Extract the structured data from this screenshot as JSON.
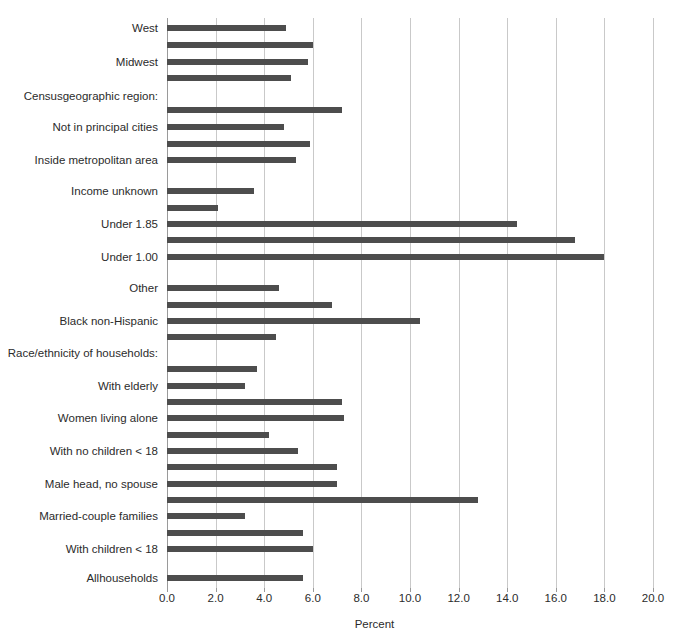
{
  "chart_data": {
    "type": "bar",
    "orientation": "horizontal",
    "title": "",
    "xlabel": "Percent",
    "ylabel": "",
    "xlim": [
      0.0,
      20.0
    ],
    "xticks": [
      "0.0",
      "2.0",
      "4.0",
      "6.0",
      "8.0",
      "10.0",
      "12.0",
      "14.0",
      "16.0",
      "18.0",
      "20.0"
    ],
    "xtick_values": [
      0,
      2,
      4,
      6,
      8,
      10,
      12,
      14,
      16,
      18,
      20
    ],
    "grid": true,
    "legend": "none",
    "bar_color": "#4d4d4d",
    "grid_color": "#c9c9c9",
    "categories": [
      "West",
      "",
      "Midwest",
      "",
      "Censusgeographic region:",
      "Not in principal cities",
      "",
      "Inside metropolitan area",
      "",
      "Income unknown",
      "",
      "Under 1.85",
      "",
      "Under 1.00",
      "",
      "Other",
      "",
      "Black non-Hispanic",
      "",
      "Race/ethnicity of households:",
      "With elderly",
      "",
      "Women living alone",
      "",
      "With no children < 18",
      "",
      "Male head, no spouse",
      "",
      "Married-couple families",
      "",
      "With children < 18",
      "",
      "Allhouseholds"
    ],
    "bars": [
      {
        "label": "West",
        "value": 4.9,
        "row": 0
      },
      {
        "label": "",
        "value": 6.0,
        "row": 1
      },
      {
        "label": "Midwest",
        "value": 5.8,
        "row": 2
      },
      {
        "label": "",
        "value": 5.1,
        "row": 3
      },
      {
        "label": "Censusgeographic region:",
        "value": null,
        "row": 4
      },
      {
        "label": "",
        "value": 7.2,
        "row": 5
      },
      {
        "label": "Not in principal cities",
        "value": 4.8,
        "row": 6
      },
      {
        "label": "",
        "value": 5.9,
        "row": 7
      },
      {
        "label": "Inside metropolitan area",
        "value": 5.3,
        "row": 8
      },
      {
        "label": "",
        "value": null,
        "row": 9
      },
      {
        "label": "Income unknown",
        "value": 3.6,
        "row": 10
      },
      {
        "label": "",
        "value": 2.1,
        "row": 11
      },
      {
        "label": "Under 1.85",
        "value": 14.4,
        "row": 12
      },
      {
        "label": "",
        "value": 16.8,
        "row": 13
      },
      {
        "label": "Under 1.00",
        "value": 18.0,
        "row": 14
      },
      {
        "label": "",
        "value": null,
        "row": 15
      },
      {
        "label": "Other",
        "value": 4.6,
        "row": 16
      },
      {
        "label": "",
        "value": 6.8,
        "row": 17
      },
      {
        "label": "Black non-Hispanic",
        "value": 10.4,
        "row": 18
      },
      {
        "label": "",
        "value": 4.5,
        "row": 19
      },
      {
        "label": "Race/ethnicity of households:",
        "value": null,
        "row": 20
      },
      {
        "label": "",
        "value": 3.7,
        "row": 21
      },
      {
        "label": "With elderly",
        "value": 3.2,
        "row": 22
      },
      {
        "label": "",
        "value": 7.2,
        "row": 23
      },
      {
        "label": "Women living alone",
        "value": 7.3,
        "row": 24
      },
      {
        "label": "",
        "value": 4.2,
        "row": 25
      },
      {
        "label": "With no children < 18",
        "value": 5.4,
        "row": 26
      },
      {
        "label": "",
        "value": 7.0,
        "row": 27
      },
      {
        "label": "Male head, no spouse",
        "value": 7.0,
        "row": 28
      },
      {
        "label": "",
        "value": 12.8,
        "row": 29
      },
      {
        "label": "Married-couple families",
        "value": 3.2,
        "row": 30
      },
      {
        "label": "",
        "value": 5.6,
        "row": 31
      },
      {
        "label": "With children < 18",
        "value": 6.0,
        "row": 32
      },
      {
        "label": "Allhouseholds",
        "value": 5.6,
        "row": 33
      }
    ]
  },
  "layout": {
    "plot_left_px": 167,
    "plot_right_px": 653,
    "plot_top_px": 18,
    "plot_bottom_px": 588,
    "bar_height_px": 6
  },
  "bar_rows": [
    {
      "y": 28,
      "value": 4.9
    },
    {
      "y": 45,
      "value": 6.0
    },
    {
      "y": 62,
      "value": 5.8
    },
    {
      "y": 78,
      "value": 5.1
    },
    {
      "y": 110,
      "value": 7.2
    },
    {
      "y": 127,
      "value": 4.8
    },
    {
      "y": 144,
      "value": 5.9
    },
    {
      "y": 160,
      "value": 5.3
    },
    {
      "y": 191,
      "value": 3.6
    },
    {
      "y": 208,
      "value": 2.1
    },
    {
      "y": 224,
      "value": 14.4
    },
    {
      "y": 240,
      "value": 16.8
    },
    {
      "y": 257,
      "value": 18.0
    },
    {
      "y": 288,
      "value": 4.6
    },
    {
      "y": 305,
      "value": 6.8
    },
    {
      "y": 321,
      "value": 10.4
    },
    {
      "y": 337,
      "value": 4.5
    },
    {
      "y": 369,
      "value": 3.7
    },
    {
      "y": 386,
      "value": 3.2
    },
    {
      "y": 402,
      "value": 7.2
    },
    {
      "y": 418,
      "value": 7.3
    },
    {
      "y": 435,
      "value": 4.2
    },
    {
      "y": 451,
      "value": 5.4
    },
    {
      "y": 467,
      "value": 7.0
    },
    {
      "y": 484,
      "value": 7.0
    },
    {
      "y": 500,
      "value": 12.8
    },
    {
      "y": 516,
      "value": 3.2
    },
    {
      "y": 533,
      "value": 5.6
    },
    {
      "y": 549,
      "value": 6.0
    },
    {
      "y": 578,
      "value": 5.6
    }
  ],
  "y_axis_labels": [
    {
      "text": "West",
      "y": 28
    },
    {
      "text": "Midwest",
      "y": 62
    },
    {
      "text": "Censusgeographic region:",
      "y": 96
    },
    {
      "text": "Not in principal cities",
      "y": 127
    },
    {
      "text": "Inside metropolitan area",
      "y": 160
    },
    {
      "text": "Income unknown",
      "y": 191
    },
    {
      "text": "Under 1.85",
      "y": 224
    },
    {
      "text": "Under 1.00",
      "y": 257
    },
    {
      "text": "Other",
      "y": 288
    },
    {
      "text": "Black non-Hispanic",
      "y": 321
    },
    {
      "text": "Race/ethnicity of households:",
      "y": 353
    },
    {
      "text": "With elderly",
      "y": 386
    },
    {
      "text": "Women living alone",
      "y": 418
    },
    {
      "text": "With no children < 18",
      "y": 451
    },
    {
      "text": "Male head, no spouse",
      "y": 484
    },
    {
      "text": "Married-couple families",
      "y": 516
    },
    {
      "text": "With children < 18",
      "y": 549
    },
    {
      "text": "Allhouseholds",
      "y": 578
    }
  ]
}
